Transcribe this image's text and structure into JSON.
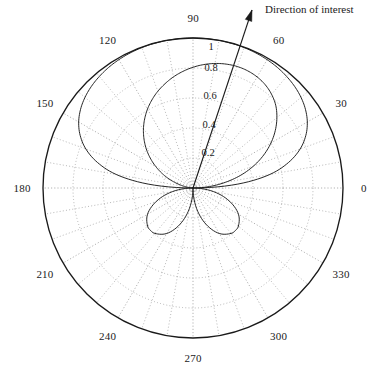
{
  "figure": {
    "type": "polar-radiation-pattern",
    "background_color": "#ffffff",
    "line_color": "#1a1a1a",
    "grid_color": "#9a9a9a",
    "center": {
      "x": 193,
      "y": 188
    },
    "outer_radius_px": 150
  },
  "annotations": {
    "direction_of_interest": {
      "label": "Direction of interest",
      "angle_deg": 72,
      "arrow_tip": {
        "x": 252,
        "y": 10
      },
      "arrow_tail": {
        "x": 193,
        "y": 188
      }
    }
  },
  "chart_data": {
    "type": "line",
    "title": "",
    "subtitle": "",
    "xlabel": "",
    "ylabel": "",
    "coordinate_system": "polar",
    "grid": true,
    "legend_position": "none",
    "angle_unit": "degrees",
    "angle_direction": "counterclockwise",
    "angle_zero_location": "east",
    "rlim": [
      0,
      1
    ],
    "r_ticks": [
      0.2,
      0.4,
      0.6,
      0.8,
      1
    ],
    "r_tick_labels": [
      "0.2",
      "0.4",
      "0.6",
      "0.8",
      "1"
    ],
    "theta_ticks": [
      0,
      30,
      60,
      90,
      120,
      150,
      180,
      210,
      240,
      270,
      300,
      330
    ],
    "theta_tick_labels": [
      "0",
      "30",
      "60",
      "90",
      "120",
      "150",
      "180",
      "210",
      "240",
      "270",
      "300",
      "330"
    ],
    "minor_theta_step_deg": 10,
    "series": [
      {
        "name": "outer pattern",
        "description": "broad upper main lobe reaching r=1 near 90 degrees, flattened top, returning to origin at 0 and 180 degrees",
        "theta": [
          0,
          5,
          10,
          15,
          20,
          25,
          30,
          35,
          40,
          45,
          50,
          55,
          60,
          65,
          70,
          75,
          80,
          85,
          90,
          95,
          100,
          105,
          110,
          115,
          120,
          125,
          130,
          135,
          140,
          145,
          150,
          155,
          160,
          165,
          170,
          175,
          180
        ],
        "r": [
          0.0,
          0.3,
          0.52,
          0.66,
          0.76,
          0.83,
          0.88,
          0.915,
          0.94,
          0.958,
          0.971,
          0.981,
          0.988,
          0.993,
          0.996,
          0.998,
          0.999,
          1.0,
          1.0,
          1.0,
          0.999,
          0.998,
          0.996,
          0.993,
          0.988,
          0.981,
          0.971,
          0.958,
          0.94,
          0.915,
          0.88,
          0.83,
          0.76,
          0.66,
          0.52,
          0.3,
          0.0
        ]
      },
      {
        "name": "outer boundary circle",
        "description": "unit circle r = 1 for all angles",
        "theta": [
          0,
          30,
          60,
          90,
          120,
          150,
          180,
          210,
          240,
          270,
          300,
          330,
          360
        ],
        "r": [
          1,
          1,
          1,
          1,
          1,
          1,
          1,
          1,
          1,
          1,
          1,
          1,
          1
        ]
      },
      {
        "name": "inner pattern",
        "description": "narrower teardrop main lobe peaking near r=0.85 around 75-80 degrees, tilted toward the direction of interest",
        "theta": [
          0,
          5,
          10,
          15,
          20,
          25,
          30,
          35,
          40,
          45,
          50,
          55,
          60,
          65,
          70,
          75,
          80,
          85,
          90,
          95,
          100,
          105,
          110,
          115,
          120,
          125,
          130,
          135,
          140,
          145,
          150,
          155,
          160,
          165,
          170,
          175,
          180
        ],
        "r": [
          0.0,
          0.11,
          0.22,
          0.33,
          0.43,
          0.52,
          0.6,
          0.67,
          0.73,
          0.78,
          0.815,
          0.84,
          0.855,
          0.862,
          0.862,
          0.855,
          0.843,
          0.826,
          0.805,
          0.78,
          0.752,
          0.72,
          0.686,
          0.648,
          0.607,
          0.562,
          0.514,
          0.462,
          0.407,
          0.348,
          0.287,
          0.225,
          0.163,
          0.103,
          0.052,
          0.018,
          0.0
        ]
      },
      {
        "name": "lower left lobe",
        "description": "sidelobe below the horizontal axis centred near 225 degrees, peak r about 0.40",
        "theta": [
          180,
          190,
          200,
          210,
          220,
          225,
          230,
          240,
          250,
          260,
          270
        ],
        "r": [
          0.0,
          0.14,
          0.26,
          0.35,
          0.395,
          0.4,
          0.395,
          0.35,
          0.26,
          0.14,
          0.0
        ]
      },
      {
        "name": "lower right lobe",
        "description": "sidelobe below the horizontal axis centred near 315 degrees, peak r about 0.40",
        "theta": [
          270,
          280,
          290,
          300,
          310,
          315,
          320,
          330,
          340,
          350,
          360
        ],
        "r": [
          0.0,
          0.14,
          0.26,
          0.35,
          0.395,
          0.4,
          0.395,
          0.35,
          0.26,
          0.14,
          0.0
        ]
      }
    ]
  }
}
